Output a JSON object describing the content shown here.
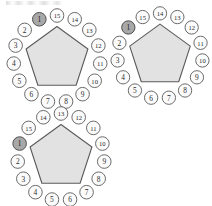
{
  "figure": {
    "title": "",
    "node_count_per_figure": 15,
    "colors": {
      "pentagon_fill": "#e2e2e2",
      "pentagon_stroke": "#5b5b5b",
      "node_fill": "#fbfbfb",
      "node_stroke": "#636363",
      "node_shaded_fill": "#a8a8a8",
      "label_color": "#2b2b2b",
      "background": "#ffffff"
    }
  },
  "diagrams": [
    {
      "id": "pentagon-1",
      "position": "top-left",
      "shaded_node": "1",
      "start_offset": 0,
      "nodes": [
        {
          "label": "1",
          "shaded": true
        },
        {
          "label": "2",
          "shaded": false
        },
        {
          "label": "3",
          "shaded": false
        },
        {
          "label": "4",
          "shaded": false
        },
        {
          "label": "5",
          "shaded": false
        },
        {
          "label": "6",
          "shaded": false
        },
        {
          "label": "7",
          "shaded": false
        },
        {
          "label": "8",
          "shaded": false
        },
        {
          "label": "9",
          "shaded": false
        },
        {
          "label": "10",
          "shaded": false
        },
        {
          "label": "11",
          "shaded": false
        },
        {
          "label": "12",
          "shaded": false
        },
        {
          "label": "13",
          "shaded": false
        },
        {
          "label": "14",
          "shaded": false
        },
        {
          "label": "15",
          "shaded": false
        }
      ]
    },
    {
      "id": "pentagon-2",
      "position": "top-right",
      "shaded_node": "1",
      "start_offset": 1,
      "nodes": [
        {
          "label": "1",
          "shaded": true
        },
        {
          "label": "2",
          "shaded": false
        },
        {
          "label": "3",
          "shaded": false
        },
        {
          "label": "4",
          "shaded": false
        },
        {
          "label": "5",
          "shaded": false
        },
        {
          "label": "6",
          "shaded": false
        },
        {
          "label": "7",
          "shaded": false
        },
        {
          "label": "8",
          "shaded": false
        },
        {
          "label": "9",
          "shaded": false
        },
        {
          "label": "10",
          "shaded": false
        },
        {
          "label": "11",
          "shaded": false
        },
        {
          "label": "12",
          "shaded": false
        },
        {
          "label": "13",
          "shaded": false
        },
        {
          "label": "14",
          "shaded": false
        },
        {
          "label": "15",
          "shaded": false
        }
      ]
    },
    {
      "id": "pentagon-3",
      "position": "bottom-left",
      "shaded_node": "1",
      "start_offset": 2,
      "nodes": [
        {
          "label": "1",
          "shaded": true
        },
        {
          "label": "2",
          "shaded": false
        },
        {
          "label": "3",
          "shaded": false
        },
        {
          "label": "4",
          "shaded": false
        },
        {
          "label": "5",
          "shaded": false
        },
        {
          "label": "6",
          "shaded": false
        },
        {
          "label": "7",
          "shaded": false
        },
        {
          "label": "8",
          "shaded": false
        },
        {
          "label": "9",
          "shaded": false
        },
        {
          "label": "10",
          "shaded": false
        },
        {
          "label": "11",
          "shaded": false
        },
        {
          "label": "12",
          "shaded": false
        },
        {
          "label": "13",
          "shaded": false
        },
        {
          "label": "14",
          "shaded": false
        },
        {
          "label": "15",
          "shaded": false
        }
      ]
    }
  ],
  "layout": {
    "figures": [
      {
        "id": "pentagon-1",
        "left": 7,
        "top": 8,
        "size": 100
      },
      {
        "id": "pentagon-2",
        "left": 111,
        "top": 6,
        "size": 98
      },
      {
        "id": "pentagon-3",
        "left": 11,
        "top": 106,
        "size": 100
      }
    ]
  }
}
